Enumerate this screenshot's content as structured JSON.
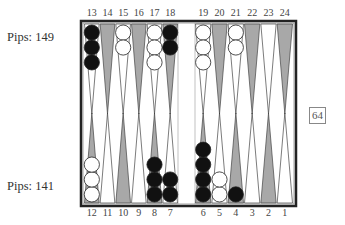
{
  "players": {
    "top": {
      "pips_label": "Pips: 149"
    },
    "bottom": {
      "pips_label": "Pips: 141"
    }
  },
  "cube": {
    "value": "64"
  },
  "board": {
    "top_point_labels": [
      "13",
      "14",
      "15",
      "16",
      "17",
      "18",
      "19",
      "20",
      "21",
      "22",
      "23",
      "24"
    ],
    "bottom_point_labels": [
      "12",
      "11",
      "10",
      "9",
      "8",
      "7",
      "6",
      "5",
      "4",
      "3",
      "2",
      "1"
    ],
    "colors": {
      "frame": "#222222",
      "dark_point": "#a8a8a8",
      "light_point": "#ffffff",
      "black_checker": "#111111",
      "white_checker": "#ffffff"
    },
    "checkers": [
      {
        "point": 13,
        "color": "black",
        "count": 3
      },
      {
        "point": 15,
        "color": "white",
        "count": 2
      },
      {
        "point": 17,
        "color": "white",
        "count": 3
      },
      {
        "point": 18,
        "color": "black",
        "count": 2
      },
      {
        "point": 19,
        "color": "white",
        "count": 3
      },
      {
        "point": 21,
        "color": "white",
        "count": 2
      },
      {
        "point": 12,
        "color": "white",
        "count": 3
      },
      {
        "point": 8,
        "color": "black",
        "count": 3
      },
      {
        "point": 7,
        "color": "black",
        "count": 2
      },
      {
        "point": 6,
        "color": "black",
        "count": 4
      },
      {
        "point": 5,
        "color": "white",
        "count": 2
      },
      {
        "point": 4,
        "color": "black",
        "count": 1
      }
    ]
  }
}
